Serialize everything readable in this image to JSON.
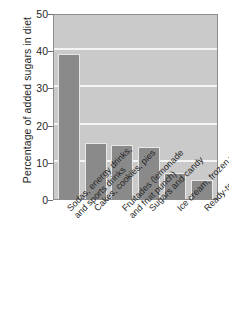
{
  "chart_data": {
    "type": "bar",
    "title": "",
    "xlabel": "",
    "ylabel": "Percentage of added sugars in diet",
    "ylim": [
      0,
      50
    ],
    "yticks": [
      0,
      10,
      20,
      30,
      40,
      50
    ],
    "grid": true,
    "legend": null,
    "categories": [
      "Sodas, energy drinks, and sports drinks",
      "Cakes, cookies, pies",
      "Fruitades (lemonade and fruit punch)",
      "Sugars and candy",
      "Ice cream, frozen yogurt",
      "Ready-to-eat cereals"
    ],
    "category_lines": [
      [
        "Sodas, energy drinks,",
        "and sports drinks"
      ],
      [
        "Cakes, cookies, pies"
      ],
      [
        "Fruitades (lemonade",
        "and fruit punch)"
      ],
      [
        "Sugars and candy"
      ],
      [
        "Ice cream, frozen yogurt"
      ],
      [
        "Ready-to-eat cereals"
      ]
    ],
    "values": [
      39,
      15,
      14.5,
      14,
      7,
      5
    ],
    "colors": {
      "bar_fill": "#8a8a8a",
      "bar_outline": "#e8e8e8",
      "plot_background": "#cacaca",
      "gridline": "#f4f4f4",
      "axis": "#8c8c8c",
      "text": "#262626",
      "page_background": "#ffffff"
    }
  }
}
